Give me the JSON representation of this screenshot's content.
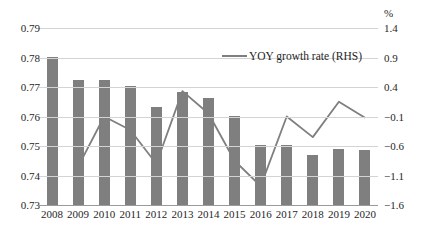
{
  "chart_data": {
    "type": "bar",
    "title": "",
    "xlabel": "",
    "ylabel": "",
    "categories": [
      "2008",
      "2009",
      "2010",
      "2011",
      "2012",
      "2013",
      "2014",
      "2015",
      "2016",
      "2017",
      "2018",
      "2019",
      "2020"
    ],
    "series": [
      {
        "name": "Share (LHS)",
        "type": "bar",
        "axis": "left",
        "color": "#7f7f7f",
        "values": [
          0.7803,
          0.7725,
          0.7724,
          0.7705,
          0.7632,
          0.7683,
          0.7664,
          0.7601,
          0.7505,
          0.7504,
          0.7471,
          0.749,
          0.7488
        ]
      },
      {
        "name": "YOY growth rate (RHS)",
        "type": "line",
        "axis": "right",
        "color": "#7f7f7f",
        "x": [
          "2009",
          "2010",
          "2011",
          "2012",
          "2013",
          "2014",
          "2015",
          "2016",
          "2017",
          "2018",
          "2019",
          "2020"
        ],
        "values": [
          -0.95,
          -0.1,
          -0.33,
          -0.9,
          0.33,
          -0.05,
          -0.85,
          -1.28,
          -0.1,
          -0.45,
          0.15,
          -0.12
        ]
      }
    ],
    "left_axis": {
      "ticks": [
        "0.73",
        "0.74",
        "0.75",
        "0.76",
        "0.77",
        "0.78",
        "0.79"
      ],
      "ylim": [
        0.73,
        0.79
      ],
      "unit": ""
    },
    "right_axis": {
      "ticks": [
        "-1.6",
        "-1.1",
        "-0.6",
        "-0.1",
        "0.4",
        "0.9",
        "1.4"
      ],
      "ylim": [
        -1.6,
        1.4
      ],
      "unit": "%"
    },
    "legend": {
      "position": "top-center",
      "entries": [
        "YOY growth rate (RHS)"
      ]
    },
    "grid": true
  },
  "legend": {
    "label": "YOY growth rate (RHS)"
  },
  "axes": {
    "right_unit": "%"
  }
}
